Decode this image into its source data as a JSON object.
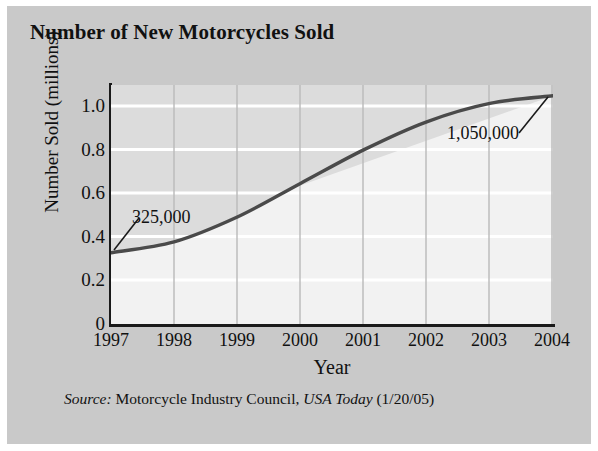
{
  "card": {
    "background": "#c9c9c9",
    "plot_background": "#f2f2f2",
    "above_curve_fill": "#dcdcdc",
    "curve_color": "#4a4a4a",
    "gridline_color": "#ffffff",
    "vertical_gridline_color": "#b9b9b9",
    "axis_color": "#1a1a1a"
  },
  "title": "Number of New Motorcycles Sold",
  "axis": {
    "y_title": "Number Sold (millions)",
    "x_title": "Year"
  },
  "annotations": {
    "start_label": "325,000",
    "end_label": "1,050,000"
  },
  "source": {
    "prefix": "Source:",
    "publisher": "Motorcycle Industry Council,",
    "paper": "USA Today",
    "date": "(1/20/05)"
  },
  "chart_data": {
    "type": "line",
    "title": "Number of New Motorcycles Sold",
    "xlabel": "Year",
    "ylabel": "Number Sold (millions)",
    "x": [
      1997,
      1998,
      1999,
      2000,
      2001,
      2002,
      2003,
      2004
    ],
    "x_tick_labels": [
      "1997",
      "1998",
      "1999",
      "2000",
      "2001",
      "2002",
      "2003",
      "2004"
    ],
    "y_tick_labels": [
      "0",
      "0.2",
      "0.4",
      "0.6",
      "0.8",
      "1.0"
    ],
    "y_ticks": [
      0,
      0.2,
      0.4,
      0.6,
      0.8,
      1.0
    ],
    "values": [
      0.325,
      0.375,
      0.49,
      0.645,
      0.8,
      0.93,
      1.015,
      1.05
    ],
    "series": [
      {
        "name": "New motorcycles sold (millions)",
        "values": [
          0.325,
          0.375,
          0.49,
          0.645,
          0.8,
          0.93,
          1.015,
          1.05
        ]
      }
    ],
    "xlim": [
      1997,
      2004
    ],
    "ylim": [
      0,
      1.1
    ],
    "grid": true,
    "legend": "none",
    "data_labels": [
      {
        "text": "325,000",
        "x": 1997,
        "y": 0.325
      },
      {
        "text": "1,050,000",
        "x": 2004,
        "y": 1.05
      }
    ]
  }
}
